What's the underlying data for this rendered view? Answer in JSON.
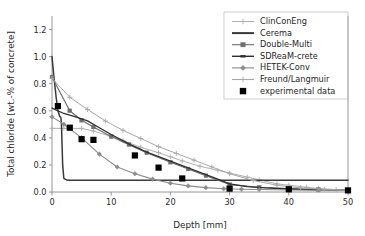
{
  "chart_data": {
    "type": "line",
    "title": "",
    "xlabel": "Depth [mm]",
    "ylabel": "Total chloride [wt.-% of concrete]",
    "xlim": [
      0,
      50
    ],
    "ylim": [
      0,
      1.3
    ],
    "xticks": [
      0,
      10,
      20,
      30,
      40,
      50
    ],
    "xticklabels": [
      "0",
      "10",
      "20",
      "30",
      "40",
      "50"
    ],
    "yticks": [
      0.0,
      0.2,
      0.4,
      0.6,
      0.8,
      1.0,
      1.2
    ],
    "yticklabels": [
      "0.0",
      "0.2",
      "0.4",
      "0.6",
      "0.8",
      "1.0",
      "1.2"
    ],
    "grid": false,
    "legend_position": "upper right",
    "series": [
      {
        "name": "ClinConEng",
        "color": "#b0b0b0",
        "marker": "cross",
        "linewidth": 1.0,
        "x": [
          0,
          2,
          5,
          7,
          10,
          12,
          15,
          18,
          20,
          22,
          25,
          28,
          30,
          33,
          35,
          38,
          40,
          43,
          45,
          48,
          50
        ],
        "y": [
          0.47,
          0.47,
          0.47,
          0.45,
          0.41,
          0.38,
          0.33,
          0.29,
          0.26,
          0.23,
          0.19,
          0.16,
          0.14,
          0.11,
          0.09,
          0.06,
          0.05,
          0.035,
          0.025,
          0.018,
          0.015
        ]
      },
      {
        "name": "Cerema",
        "color": "#3a3a3a",
        "marker": "none",
        "linewidth": 1.5,
        "x": [
          0,
          0.3,
          0.7,
          1.0,
          1.3,
          1.5,
          1.6,
          1.7,
          1.8,
          2.0,
          2.5,
          3.0,
          5.0,
          7.0,
          10.0,
          13.0,
          16.0,
          20.0,
          24.0,
          27.0,
          30.0,
          35.0,
          40.0,
          45.0,
          50.0
        ],
        "y": [
          1.0,
          0.86,
          0.7,
          0.6,
          0.56,
          0.55,
          0.5,
          0.35,
          0.2,
          0.1,
          0.088,
          0.086,
          0.086,
          0.086,
          0.086,
          0.086,
          0.086,
          0.086,
          0.086,
          0.086,
          0.086,
          0.086,
          0.086,
          0.086,
          0.086
        ]
      },
      {
        "name": "Double-Multi",
        "color": "#6e6e6e",
        "marker": "square",
        "linewidth": 1.2,
        "x": [
          0,
          3,
          5,
          7,
          10,
          13,
          16,
          20,
          23,
          26,
          30,
          35,
          40,
          45,
          50
        ],
        "y": [
          0.85,
          0.6,
          0.53,
          0.48,
          0.41,
          0.35,
          0.29,
          0.22,
          0.17,
          0.12,
          0.055,
          0.035,
          0.025,
          0.018,
          0.014
        ]
      },
      {
        "name": "SDReaM-crete",
        "color": "#2e2e2e",
        "marker": "none",
        "linewidth": 1.3,
        "x": [
          0,
          2,
          4,
          6,
          8,
          10,
          13,
          16,
          19,
          22,
          25,
          28,
          30,
          33,
          36,
          40,
          45,
          50
        ],
        "y": [
          0.62,
          0.58,
          0.555,
          0.525,
          0.475,
          0.425,
          0.355,
          0.295,
          0.245,
          0.195,
          0.145,
          0.095,
          0.06,
          0.04,
          0.03,
          0.022,
          0.016,
          0.013
        ]
      },
      {
        "name": "HETEK-Conv",
        "color": "#8c8c8c",
        "marker": "diamond",
        "linewidth": 1.1,
        "x": [
          0,
          2,
          5,
          8,
          11,
          14,
          17,
          20,
          23,
          26,
          29,
          32,
          35,
          40,
          45,
          50
        ],
        "y": [
          0.555,
          0.5,
          0.4,
          0.28,
          0.185,
          0.135,
          0.095,
          0.065,
          0.045,
          0.032,
          0.024,
          0.02,
          0.018,
          0.015,
          0.013,
          0.012
        ]
      },
      {
        "name": "Freund/Langmuir",
        "color": "#a8a8a8",
        "marker": "cross",
        "linewidth": 1.0,
        "x": [
          0,
          3,
          6,
          9,
          12,
          15,
          18,
          21,
          24,
          27,
          30,
          34,
          38,
          42,
          46,
          50
        ],
        "y": [
          0.84,
          0.7,
          0.61,
          0.525,
          0.455,
          0.395,
          0.335,
          0.285,
          0.235,
          0.185,
          0.135,
          0.085,
          0.05,
          0.03,
          0.02,
          0.015
        ]
      }
    ],
    "scatter": {
      "name": "experimental data",
      "color": "#000000",
      "marker": "square",
      "x": [
        1,
        3,
        5,
        7,
        14,
        18,
        22,
        30,
        40,
        50
      ],
      "y": [
        0.635,
        0.475,
        0.39,
        0.385,
        0.27,
        0.18,
        0.1,
        0.025,
        0.02,
        0.012
      ]
    },
    "legend_entries": [
      {
        "label": "ClinConEng",
        "color": "#b0b0b0",
        "style": "line-cross"
      },
      {
        "label": "Cerema",
        "color": "#3a3a3a",
        "style": "line-thick"
      },
      {
        "label": "Double-Multi",
        "color": "#6e6e6e",
        "style": "line-square"
      },
      {
        "label": "SDReaM-crete",
        "color": "#2e2e2e",
        "style": "line-plain"
      },
      {
        "label": "HETEK-Conv",
        "color": "#8c8c8c",
        "style": "line-diamond"
      },
      {
        "label": "Freund/Langmuir",
        "color": "#a8a8a8",
        "style": "line-cross"
      },
      {
        "label": "experimental data",
        "color": "#000000",
        "style": "square-only"
      }
    ]
  }
}
